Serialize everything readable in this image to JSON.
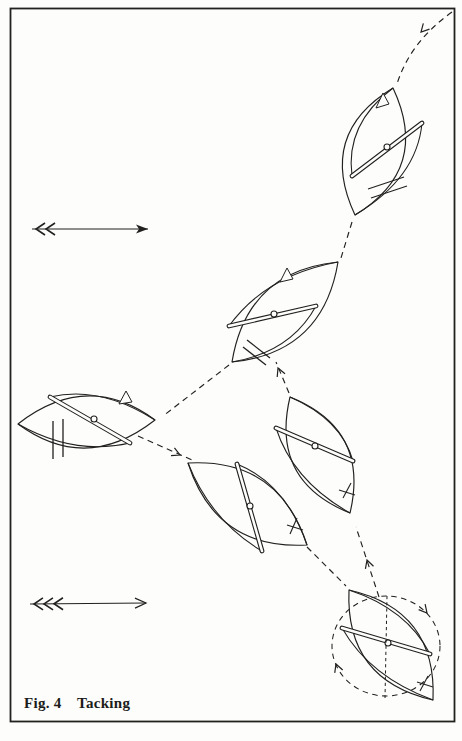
{
  "figure": {
    "label": "Fig. 4",
    "title": "Tacking"
  },
  "colors": {
    "ink": "#22211f",
    "paper": "#fdfdfb"
  },
  "diagram": {
    "frame": {
      "x": 10.5,
      "y": 8.5,
      "width": 444,
      "height": 713
    },
    "wind_arrows": [
      {
        "name": "wind-arrow-top",
        "x1": 32,
        "y1": 229,
        "x2": 148,
        "y2": 229,
        "head": "filled",
        "feathers": 2
      },
      {
        "name": "wind-arrow-bottom",
        "x1": 30,
        "y1": 604,
        "x2": 146,
        "y2": 603,
        "head": "open",
        "feathers": 3
      }
    ],
    "path_segments": [
      {
        "d": "M452,12 Q410,42 397,84",
        "arrow": {
          "x": 421,
          "y": 32,
          "angle": 133
        }
      },
      {
        "d": "M352,222 L341,258"
      },
      {
        "d": "M229,365 L163,416"
      },
      {
        "d": "M138,436 L192,460",
        "arrow": {
          "x": 180,
          "y": 455,
          "angle": 24
        }
      },
      {
        "d": "M307,547 L346,586"
      },
      {
        "d": "M379,597 L356,527",
        "arrow": {
          "x": 367,
          "y": 560,
          "angle": -108
        }
      },
      {
        "d": "M289,393 L276,362",
        "arrow": {
          "x": 278,
          "y": 368,
          "angle": -113
        }
      }
    ],
    "boats": [
      {
        "id": "top-right",
        "hull": {
          "tipA": [
            393,
            88
          ],
          "tipB": [
            355,
            215
          ],
          "ctrl1": [
            317,
            134
          ],
          "ctrl2": [
            431,
            169
          ]
        },
        "sail1": [
          393,
          88,
          345,
          124,
          352,
          176
        ],
        "sail2": [
          422,
          123,
          417,
          178,
          355,
          215
        ],
        "boom": [
          422,
          123,
          352,
          176
        ],
        "mast": [
          387,
          147
        ],
        "flag": [
          [
            383,
            93
          ],
          [
            376,
            108
          ],
          [
            389,
            104
          ]
        ],
        "hash": [
          [
            368,
            189,
            404,
            177
          ],
          [
            371,
            198,
            407,
            186
          ]
        ]
      },
      {
        "id": "upper-middle",
        "hull": {
          "tipA": [
            338,
            262
          ],
          "tipB": [
            232,
            362
          ],
          "ctrl1": [
            247,
            271
          ],
          "ctrl2": [
            323,
            353
          ]
        },
        "sail1": [
          338,
          262,
          266,
          275,
          229,
          326
        ],
        "sail2": [
          316,
          306,
          291,
          352,
          232,
          362
        ],
        "boom": [
          316,
          306,
          229,
          326
        ],
        "mast": [
          274,
          314
        ],
        "flag": [
          [
            287,
            268
          ],
          [
            280,
            282
          ],
          [
            293,
            279
          ]
        ],
        "hash": [
          [
            247,
            340,
            270,
            358
          ],
          [
            243,
            347,
            266,
            365
          ]
        ]
      },
      {
        "id": "left",
        "hull": {
          "tipA": [
            155,
            420
          ],
          "tipB": [
            18,
            424
          ],
          "ctrl1": [
            87,
            370
          ],
          "ctrl2": [
            86,
            474
          ]
        },
        "sail1": [
          155,
          420,
          100,
          385,
          50,
          397
        ],
        "sail2": [
          130,
          443,
          74,
          456,
          18,
          424
        ],
        "boom": [
          50,
          397,
          130,
          443
        ],
        "mast": [
          94,
          419
        ],
        "flag": [
          [
            126,
            391
          ],
          [
            119,
            404
          ],
          [
            132,
            402
          ]
        ],
        "hash": [
          [
            53,
            421,
            53,
            459
          ],
          [
            63,
            419,
            63,
            457
          ]
        ]
      },
      {
        "id": "lower-middle",
        "hull": {
          "tipA": [
            188,
            463
          ],
          "tipB": [
            307,
            545
          ],
          "ctrl1": [
            216,
            550
          ],
          "ctrl2": [
            279,
            458
          ]
        },
        "sail1": [
          188,
          463,
          211,
          521,
          262,
          551
        ],
        "sail2": [
          237,
          464,
          286,
          484,
          307,
          545
        ],
        "boom": [
          237,
          464,
          262,
          551
        ],
        "mast": [
          250,
          506
        ],
        "tiller": [
          [
            297,
            518,
            290,
            534
          ],
          [
            287,
            525,
            303,
            530
          ]
        ]
      },
      {
        "id": "right-middle",
        "hull": {
          "tipA": [
            290,
            397
          ],
          "tipB": [
            350,
            513
          ],
          "ctrl1": [
            270,
            481
          ],
          "ctrl2": [
            370,
            429
          ]
        },
        "sail1": [
          290,
          397,
          341,
          419,
          353,
          461
        ],
        "sail2": [
          276,
          428,
          293,
          481,
          350,
          513
        ],
        "boom": [
          276,
          428,
          353,
          461
        ],
        "mast": [
          315,
          446
        ],
        "tiller": [
          [
            351,
            483,
            343,
            498
          ],
          [
            339,
            490,
            355,
            495
          ]
        ]
      },
      {
        "id": "bottom-right",
        "hull": {
          "tipA": [
            349,
            590
          ],
          "tipB": [
            433,
            700
          ],
          "ctrl1": [
            345,
            680
          ],
          "ctrl2": [
            437,
            610
          ]
        },
        "sail1": [
          349,
          590,
          407,
          609,
          430,
          654
        ],
        "sail2": [
          342,
          628,
          370,
          677,
          433,
          700
        ],
        "boom": [
          342,
          628,
          430,
          654
        ],
        "mast": [
          388,
          643
        ],
        "tiller": [
          [
            428,
            676,
            420,
            691
          ],
          [
            417,
            682,
            433,
            687
          ]
        ]
      }
    ],
    "turning_circle": {
      "cx": 386,
      "cy": 646,
      "rx": 54,
      "ry": 50,
      "arrows": [
        {
          "x": 427,
          "y": 613,
          "angle": 50
        },
        {
          "x": 336,
          "y": 664,
          "angle": -110
        }
      ],
      "heading_line": {
        "x1": 387,
        "y1": 596,
        "x2": 385,
        "y2": 698
      }
    }
  }
}
